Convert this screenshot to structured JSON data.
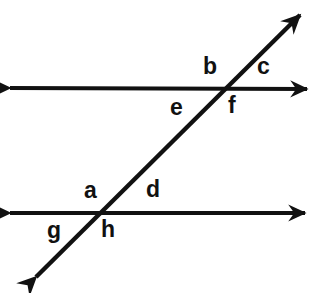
{
  "figure": {
    "background_color": "#ffffff",
    "stroke_color": "#111111",
    "label_color": "#111111",
    "stroke_width": 4,
    "width": 313,
    "height": 293
  },
  "lines": [
    {
      "name": "upper-parallel-line",
      "kind": "double-arrow-line",
      "x1": 10,
      "y1": 88,
      "x2": 307,
      "y2": 89
    },
    {
      "name": "lower-parallel-line",
      "kind": "double-arrow-line",
      "x1": 10,
      "y1": 213,
      "x2": 305,
      "y2": 213
    },
    {
      "name": "transversal-line",
      "kind": "double-arrow-line",
      "x1": 36,
      "y1": 277,
      "x2": 300,
      "y2": 15
    }
  ],
  "intersections": [
    {
      "name": "upper-intersection",
      "x": 225,
      "y": 88
    },
    {
      "name": "lower-intersection",
      "x": 101,
      "y": 213
    }
  ],
  "labels": [
    {
      "id": "b",
      "text": "b",
      "x": 203,
      "y": 55,
      "position": "upper-left-of-upper-intersection"
    },
    {
      "id": "c",
      "text": "c",
      "x": 257,
      "y": 55,
      "position": "upper-right-of-upper-intersection"
    },
    {
      "id": "e",
      "text": "e",
      "x": 170,
      "y": 96,
      "position": "lower-left-of-upper-intersection"
    },
    {
      "id": "f",
      "text": "f",
      "x": 228,
      "y": 94,
      "position": "lower-right-of-upper-intersection"
    },
    {
      "id": "a",
      "text": "a",
      "x": 84,
      "y": 179,
      "position": "upper-left-of-lower-intersection"
    },
    {
      "id": "d",
      "text": "d",
      "x": 146,
      "y": 178,
      "position": "upper-right-of-lower-intersection"
    },
    {
      "id": "g",
      "text": "g",
      "x": 47,
      "y": 219,
      "position": "lower-left-of-lower-intersection"
    },
    {
      "id": "h",
      "text": "h",
      "x": 101,
      "y": 218,
      "position": "lower-right-of-lower-intersection"
    }
  ]
}
